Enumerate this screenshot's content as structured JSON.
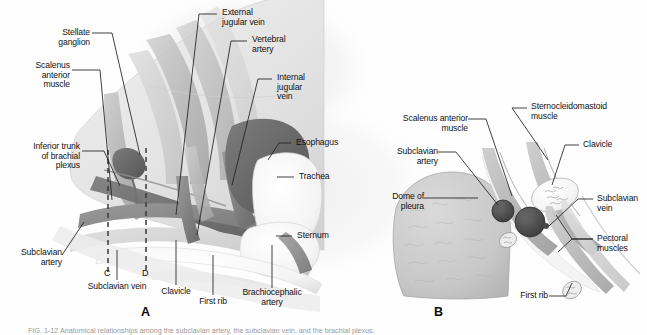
{
  "figure": {
    "type": "anatomical-illustration",
    "panels": [
      {
        "id": "A",
        "letter": "A",
        "view": "lateral view of root of neck and thoracic inlet",
        "labels": [
          {
            "name": "stellate-ganglion",
            "text": "Stellate\nganglion",
            "align": "right"
          },
          {
            "name": "scalenus-anterior-muscle",
            "text": "Scalenus\nanterior\nmuscle",
            "align": "right"
          },
          {
            "name": "inferior-trunk-of-brachial-plexus",
            "text": "Inferior trunk\nof brachial\nplexus",
            "align": "right"
          },
          {
            "name": "subclavian-artery",
            "text": "Subclavian\nartery",
            "align": "right"
          },
          {
            "name": "subclavian-vein",
            "text": "Subclavian vein",
            "align": "center"
          },
          {
            "name": "clavicle",
            "text": "Clavicle",
            "align": "center"
          },
          {
            "name": "first-rib",
            "text": "First rib",
            "align": "center"
          },
          {
            "name": "brachiocephalic-artery",
            "text": "Brachiocephalic\nartery",
            "align": "center"
          },
          {
            "name": "external-jugular-vein",
            "text": "External\njugular vein",
            "align": "left"
          },
          {
            "name": "vertebral-artery",
            "text": "Vertebral\nartery",
            "align": "left"
          },
          {
            "name": "internal-jugular-vein",
            "text": "Internal\njugular\nvein",
            "align": "left"
          },
          {
            "name": "esophagus",
            "text": "Esophagus",
            "align": "left"
          },
          {
            "name": "trachea",
            "text": "Trachea",
            "align": "left"
          },
          {
            "name": "sternum",
            "text": "Sternum",
            "align": "left"
          }
        ],
        "section_markers": [
          "C",
          "D"
        ]
      },
      {
        "id": "B",
        "letter": "B",
        "view": "cross section at the level of the clavicle",
        "labels": [
          {
            "name": "scalenus-anterior-muscle",
            "text": "Scalenus anterior\nmuscle",
            "align": "right"
          },
          {
            "name": "subclavian-artery",
            "text": "Subclavian\nartery",
            "align": "right"
          },
          {
            "name": "dome-of-pleura",
            "text": "Dome of\npleura",
            "align": "right"
          },
          {
            "name": "sternocleidomastoid-muscle",
            "text": "Sternocleidomastoid\nmuscle",
            "align": "left"
          },
          {
            "name": "clavicle",
            "text": "Clavicle",
            "align": "left"
          },
          {
            "name": "subclavian-vein",
            "text": "Subclavian\nvein",
            "align": "left"
          },
          {
            "name": "pectoral-muscles",
            "text": "Pectoral\nmuscles",
            "align": "left"
          },
          {
            "name": "first-rib",
            "text": "First rib",
            "align": "right"
          }
        ]
      }
    ],
    "caption": "FIG. 1-12   Anatomical relationships among the subclavian artery, the subclavian vein, and the brachial plexus.",
    "colors": {
      "ink": "#111111",
      "leader_line": "#2a2a2a",
      "artery": "#8d8d8d",
      "vein": "#6f6f6f",
      "muscle": "#b9b9b9",
      "bone": "#f2f2f2",
      "pleura": "#c6c6c6",
      "background": "#ffffff"
    }
  }
}
